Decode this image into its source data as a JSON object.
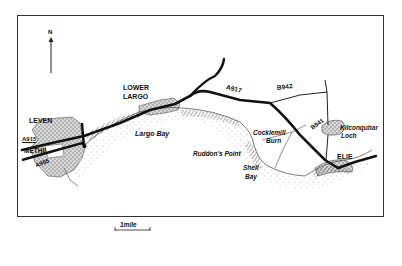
{
  "map": {
    "north_label": "N",
    "towns": [
      {
        "name": "LOWER",
        "x": 123,
        "y": 86
      },
      {
        "name": "LARGO",
        "x": 123,
        "y": 95
      },
      {
        "name": "LEVEN",
        "x": 29,
        "y": 119
      },
      {
        "name": "METHIL",
        "x": 24,
        "y": 150
      },
      {
        "name": "ELIE",
        "x": 337,
        "y": 155
      }
    ],
    "roads": [
      {
        "name": "A917",
        "x": 227,
        "y": 89
      },
      {
        "name": "B942",
        "x": 277,
        "y": 86
      },
      {
        "name": "B941",
        "x": 310,
        "y": 123
      },
      {
        "name": "A915",
        "x": 22,
        "y": 138
      },
      {
        "name": "A955",
        "x": 35,
        "y": 161
      }
    ],
    "features": [
      {
        "name": "Largo Bay",
        "x": 135,
        "y": 132
      },
      {
        "name": "Ruddon's Point",
        "x": 193,
        "y": 153
      },
      {
        "name": "Cocklemill",
        "x": 253,
        "y": 132
      },
      {
        "name": "Burn",
        "x": 266,
        "y": 140
      },
      {
        "name": "Kilconquhar",
        "x": 340,
        "y": 127
      },
      {
        "name": "Loch",
        "x": 341,
        "y": 135
      },
      {
        "name": "Shell",
        "x": 243,
        "y": 167
      },
      {
        "name": "Bay",
        "x": 245,
        "y": 176
      }
    ],
    "scale_label": "1mile"
  }
}
